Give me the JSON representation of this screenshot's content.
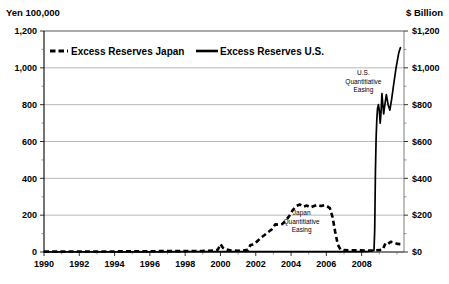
{
  "chart_data": {
    "type": "line",
    "title": "",
    "subtitle": "",
    "xlabel": "",
    "ylabel": "Yen 100,000",
    "y2label": "$ Billion",
    "xlim": [
      1990,
      2010.4
    ],
    "ylim": [
      0,
      1200
    ],
    "y2lim": [
      0,
      1200
    ],
    "grid": true,
    "legend_position": "top-inside",
    "x_tick_labels": [
      "1990",
      "1992",
      "1994",
      "1996",
      "1998",
      "2000",
      "2002",
      "2004",
      "2006",
      "2008"
    ],
    "x_tick_values": [
      1990,
      1992,
      1994,
      1996,
      1998,
      2000,
      2002,
      2004,
      2006,
      2008
    ],
    "x_minor_tick_step": 1,
    "y_tick_labels": [
      "0",
      "200",
      "400",
      "600",
      "800",
      "1,000",
      "1,200"
    ],
    "y_tick_values": [
      0,
      200,
      400,
      600,
      800,
      1000,
      1200
    ],
    "y2_tick_labels": [
      "$0",
      "$200",
      "$400",
      "$600",
      "$800",
      "$1,000",
      "$1,200"
    ],
    "y2_tick_values": [
      0,
      200,
      400,
      600,
      800,
      1000,
      1200
    ],
    "series": [
      {
        "name": "Excess Reserves Japan",
        "style": "dashed",
        "color": "#000000",
        "axis": "left",
        "points": [
          [
            1990.0,
            2
          ],
          [
            1991.0,
            2
          ],
          [
            1992.0,
            3
          ],
          [
            1993.0,
            3
          ],
          [
            1994.0,
            3
          ],
          [
            1995.0,
            4
          ],
          [
            1996.0,
            4
          ],
          [
            1997.0,
            5
          ],
          [
            1998.0,
            5
          ],
          [
            1999.0,
            6
          ],
          [
            1999.6,
            8
          ],
          [
            1999.85,
            12
          ],
          [
            2000.0,
            42
          ],
          [
            2000.15,
            22
          ],
          [
            2000.3,
            14
          ],
          [
            2000.6,
            8
          ],
          [
            2001.0,
            7
          ],
          [
            2001.3,
            8
          ],
          [
            2001.55,
            12
          ],
          [
            2001.7,
            38
          ],
          [
            2001.9,
            42
          ],
          [
            2002.1,
            60
          ],
          [
            2002.3,
            78
          ],
          [
            2002.5,
            92
          ],
          [
            2002.7,
            108
          ],
          [
            2002.9,
            122
          ],
          [
            2003.1,
            150
          ],
          [
            2003.3,
            148
          ],
          [
            2003.5,
            152
          ],
          [
            2003.7,
            170
          ],
          [
            2003.9,
            196
          ],
          [
            2004.1,
            228
          ],
          [
            2004.3,
            250
          ],
          [
            2004.5,
            258
          ],
          [
            2004.7,
            246
          ],
          [
            2004.9,
            252
          ],
          [
            2005.1,
            242
          ],
          [
            2005.3,
            250
          ],
          [
            2005.5,
            256
          ],
          [
            2005.7,
            250
          ],
          [
            2005.9,
            254
          ],
          [
            2006.05,
            248
          ],
          [
            2006.2,
            238
          ],
          [
            2006.35,
            190
          ],
          [
            2006.5,
            110
          ],
          [
            2006.65,
            40
          ],
          [
            2006.8,
            14
          ],
          [
            2007.0,
            10
          ],
          [
            2007.4,
            9
          ],
          [
            2007.8,
            9
          ],
          [
            2008.2,
            8
          ],
          [
            2008.6,
            8
          ],
          [
            2008.8,
            9
          ],
          [
            2009.0,
            10
          ],
          [
            2009.2,
            14
          ],
          [
            2009.35,
            48
          ],
          [
            2009.5,
            44
          ],
          [
            2009.65,
            56
          ],
          [
            2009.85,
            50
          ],
          [
            2010.05,
            44
          ],
          [
            2010.25,
            42
          ]
        ]
      },
      {
        "name": "Excess Reserves U.S.",
        "style": "solid",
        "color": "#000000",
        "axis": "right",
        "points": [
          [
            1990.0,
            1
          ],
          [
            1992.0,
            1
          ],
          [
            1994.0,
            1
          ],
          [
            1996.0,
            1
          ],
          [
            1998.0,
            2
          ],
          [
            2000.0,
            2
          ],
          [
            2002.0,
            2
          ],
          [
            2004.0,
            2
          ],
          [
            2006.0,
            2
          ],
          [
            2007.0,
            2
          ],
          [
            2008.0,
            2
          ],
          [
            2008.4,
            3
          ],
          [
            2008.62,
            6
          ],
          [
            2008.7,
            10
          ],
          [
            2008.74,
            120
          ],
          [
            2008.78,
            430
          ],
          [
            2008.82,
            620
          ],
          [
            2008.86,
            720
          ],
          [
            2008.9,
            780
          ],
          [
            2008.95,
            800
          ],
          [
            2009.0,
            770
          ],
          [
            2009.05,
            700
          ],
          [
            2009.1,
            760
          ],
          [
            2009.15,
            860
          ],
          [
            2009.2,
            800
          ],
          [
            2009.25,
            750
          ],
          [
            2009.3,
            790
          ],
          [
            2009.4,
            855
          ],
          [
            2009.5,
            800
          ],
          [
            2009.6,
            770
          ],
          [
            2009.7,
            830
          ],
          [
            2009.8,
            900
          ],
          [
            2009.95,
            1000
          ],
          [
            2010.1,
            1080
          ],
          [
            2010.2,
            1110
          ]
        ]
      }
    ],
    "annotations": [
      {
        "id": "us-qe",
        "lines": [
          "U.S.",
          "Quantitiative",
          "Easing"
        ],
        "x": 2008.1,
        "y": 960
      },
      {
        "id": "japan-qe",
        "lines": [
          "Japan",
          "Quantitiative",
          "Easing"
        ],
        "x": 2004.6,
        "y": 200
      }
    ],
    "legend": [
      {
        "label": "Excess Reserves Japan",
        "style": "dashed"
      },
      {
        "label": "Excess Reserves U.S.",
        "style": "solid"
      }
    ]
  }
}
